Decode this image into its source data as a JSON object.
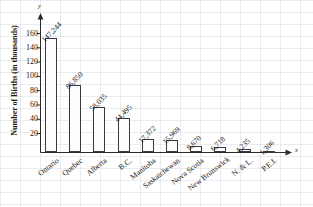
{
  "chart_data": {
    "type": "bar",
    "title": "",
    "xlabel": "x",
    "ylabel": "Number of Births (in thousands)",
    "categories": [
      "Ontario",
      "Quebec",
      "Alberta",
      "B.C.",
      "Manitoba",
      "Saskatchewan",
      "Nova Scotia",
      "New Brunswick",
      "N. & L.",
      "P.E.I."
    ],
    "values": [
      147244,
      86850,
      58035,
      44495,
      17372,
      15969,
      8670,
      6718,
      4235,
      1306
    ],
    "value_labels": [
      "147,244",
      "86,850",
      "58,035",
      "44,495",
      "17,372",
      "15,969",
      "8,670",
      "6,718",
      "4,235",
      "1,306"
    ],
    "y_tick_labels": [
      "160",
      "140",
      "120",
      "100",
      "80",
      "60",
      "40",
      "20"
    ],
    "y_tick_values": [
      160,
      140,
      120,
      100,
      80,
      60,
      40,
      20
    ],
    "ylim": [
      0,
      172
    ],
    "y_units": "thousands",
    "grid": true,
    "legend": null,
    "axis_letters": {
      "y": "y",
      "x": "x"
    }
  },
  "axes": {
    "y_title": "Number of Births (in thousands)",
    "y_letter": "y",
    "x_letter": "x"
  }
}
